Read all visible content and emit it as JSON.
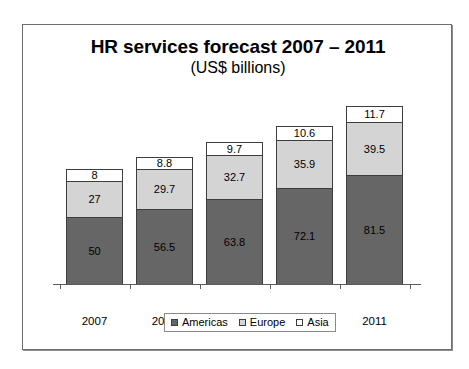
{
  "chart_data": {
    "type": "bar",
    "subtype": "stacked-bar",
    "title": "HR services forecast 2007 – 2011",
    "subtitle": "(US$ billions)",
    "xlabel": "",
    "ylabel": "",
    "grid": false,
    "legend_position": "bottom",
    "axis": {
      "baseline_value": 0,
      "ymax_implied": 132.7
    },
    "categories": [
      "2007",
      "2008",
      "2009",
      "2010",
      "2011"
    ],
    "series": [
      {
        "name": "Americas",
        "color": "#666666",
        "values": [
          50,
          56.5,
          63.8,
          72.1,
          81.5
        ],
        "labels": [
          "50",
          "56.5",
          "63.8",
          "72.1",
          "81.5"
        ]
      },
      {
        "name": "Europe",
        "color": "#d4d4d4",
        "values": [
          27,
          29.7,
          32.7,
          35.9,
          39.5
        ],
        "labels": [
          "27",
          "29.7",
          "32.7",
          "35.9",
          "39.5"
        ]
      },
      {
        "name": "Asia",
        "color": "#ffffff",
        "values": [
          8,
          8.8,
          9.7,
          10.6,
          11.7
        ],
        "labels": [
          "8",
          "8.8",
          "9.7",
          "10.6",
          "11.7"
        ]
      }
    ],
    "totals": [
      85,
      95,
      106.2,
      118.6,
      132.7
    ]
  },
  "legend": {
    "items": [
      {
        "label": "Americas",
        "icon": "square-swatch-dark"
      },
      {
        "label": "Europe",
        "icon": "square-swatch-light"
      },
      {
        "label": "Asia",
        "icon": "square-swatch-white"
      }
    ]
  }
}
